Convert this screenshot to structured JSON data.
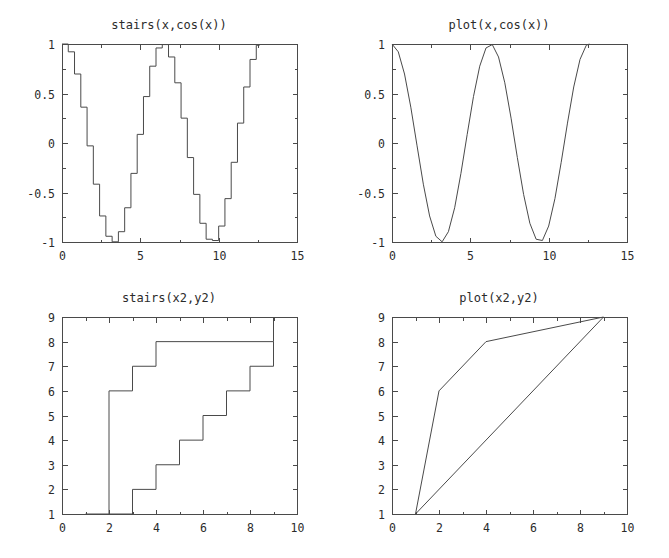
{
  "figure": {
    "width": 669,
    "height": 558,
    "background": "#ffffff",
    "line_color": "#4a4a4a",
    "text_color": "#2b2b2b",
    "layout": "2x2 subplot grid"
  },
  "chart_data": [
    {
      "id": "stairs-cos",
      "type": "line",
      "subtype": "stairs",
      "title": "stairs(x,cos(x))",
      "xlabel": "",
      "ylabel": "",
      "xlim": [
        0,
        15
      ],
      "ylim": [
        -1,
        1
      ],
      "xticks": [
        0,
        5,
        10,
        15
      ],
      "xticklabels": [
        "0",
        "5",
        "10",
        "15"
      ],
      "yticks": [
        -1,
        -0.5,
        0,
        0.5,
        1
      ],
      "yticklabels": [
        "-1",
        "-0.5",
        "0",
        "0.5",
        "1"
      ],
      "grid": false,
      "legend": null,
      "x": [
        0,
        0.4,
        0.8,
        1.2,
        1.6,
        2.0,
        2.4,
        2.8,
        3.2,
        3.6,
        4.0,
        4.4,
        4.8,
        5.2,
        5.6,
        6.0,
        6.4,
        6.8,
        7.2,
        7.6,
        8.0,
        8.4,
        8.8,
        9.2,
        9.6,
        10.0,
        10.4,
        10.8,
        11.2,
        11.6,
        12.0,
        12.4,
        12.6
      ],
      "y": [
        1.0,
        0.921,
        0.697,
        0.362,
        -0.029,
        -0.416,
        -0.737,
        -0.942,
        -0.998,
        -0.896,
        -0.654,
        -0.307,
        0.087,
        0.469,
        0.776,
        0.96,
        0.994,
        0.869,
        0.608,
        0.251,
        -0.147,
        -0.519,
        -0.811,
        -0.972,
        -0.985,
        -0.839,
        -0.562,
        -0.195,
        0.201,
        0.566,
        0.844,
        0.987,
        1.0
      ]
    },
    {
      "id": "plot-cos",
      "type": "line",
      "subtype": "continuous",
      "title": "plot(x,cos(x))",
      "xlabel": "",
      "ylabel": "",
      "xlim": [
        0,
        15
      ],
      "ylim": [
        -1,
        1
      ],
      "xticks": [
        0,
        5,
        10,
        15
      ],
      "xticklabels": [
        "0",
        "5",
        "10",
        "15"
      ],
      "yticks": [
        -1,
        -0.5,
        0,
        0.5,
        1
      ],
      "yticklabels": [
        "-1",
        "-0.5",
        "0",
        "0.5",
        "1"
      ],
      "grid": false,
      "legend": null,
      "x": [
        0,
        0.4,
        0.8,
        1.2,
        1.6,
        2.0,
        2.4,
        2.8,
        3.2,
        3.6,
        4.0,
        4.4,
        4.8,
        5.2,
        5.6,
        6.0,
        6.4,
        6.8,
        7.2,
        7.6,
        8.0,
        8.4,
        8.8,
        9.2,
        9.6,
        10.0,
        10.4,
        10.8,
        11.2,
        11.6,
        12.0,
        12.4,
        12.6
      ],
      "y": [
        1.0,
        0.921,
        0.697,
        0.362,
        -0.029,
        -0.416,
        -0.737,
        -0.942,
        -0.998,
        -0.896,
        -0.654,
        -0.307,
        0.087,
        0.469,
        0.776,
        0.96,
        0.994,
        0.869,
        0.608,
        0.251,
        -0.147,
        -0.519,
        -0.811,
        -0.972,
        -0.985,
        -0.839,
        -0.562,
        -0.195,
        0.201,
        0.566,
        0.844,
        0.987,
        1.0
      ]
    },
    {
      "id": "stairs-x2y2",
      "type": "line",
      "subtype": "stairs",
      "title": "stairs(x2,y2)",
      "xlabel": "",
      "ylabel": "",
      "xlim": [
        0,
        10
      ],
      "ylim": [
        1,
        9
      ],
      "xticks": [
        0,
        2,
        4,
        6,
        8,
        10
      ],
      "xticklabels": [
        "0",
        "2",
        "4",
        "6",
        "8",
        "10"
      ],
      "yticks": [
        1,
        2,
        3,
        4,
        5,
        6,
        7,
        8,
        9
      ],
      "yticklabels": [
        "1",
        "2",
        "3",
        "4",
        "5",
        "6",
        "7",
        "8",
        "9"
      ],
      "grid": false,
      "legend": null,
      "series": [
        {
          "name": "series-a",
          "x": [
            1,
            2,
            3,
            4,
            9
          ],
          "y": [
            1,
            6,
            7,
            8,
            9
          ]
        },
        {
          "name": "series-b",
          "x": [
            2,
            3,
            4,
            5,
            6,
            7,
            8,
            9
          ],
          "y": [
            1,
            2,
            3,
            4,
            5,
            6,
            7,
            8
          ]
        }
      ]
    },
    {
      "id": "plot-x2y2",
      "type": "line",
      "subtype": "continuous",
      "title": "plot(x2,y2)",
      "xlabel": "",
      "ylabel": "",
      "xlim": [
        0,
        10
      ],
      "ylim": [
        1,
        9
      ],
      "xticks": [
        0,
        2,
        4,
        6,
        8,
        10
      ],
      "xticklabels": [
        "0",
        "2",
        "4",
        "6",
        "8",
        "10"
      ],
      "yticks": [
        1,
        2,
        3,
        4,
        5,
        6,
        7,
        8,
        9
      ],
      "yticklabels": [
        "1",
        "2",
        "3",
        "4",
        "5",
        "6",
        "7",
        "8",
        "9"
      ],
      "grid": false,
      "legend": null,
      "series": [
        {
          "name": "series-a",
          "x": [
            1,
            2,
            4,
            9
          ],
          "y": [
            1,
            6,
            8,
            9
          ]
        },
        {
          "name": "series-b",
          "x": [
            1,
            9
          ],
          "y": [
            1,
            9
          ]
        }
      ]
    }
  ],
  "panels": {
    "top_left": {
      "title": "stairs(x,cos(x))",
      "chart_index": 0,
      "box": {
        "left": 8,
        "top": 18,
        "width": 322,
        "height": 262
      },
      "axes": {
        "x": 54,
        "y": 26,
        "w": 235,
        "h": 198
      }
    },
    "top_right": {
      "title": "plot(x,cos(x))",
      "chart_index": 1,
      "box": {
        "left": 338,
        "top": 18,
        "width": 322,
        "height": 262
      },
      "axes": {
        "x": 54,
        "y": 26,
        "w": 235,
        "h": 198
      }
    },
    "bottom_left": {
      "title": "stairs(x2,y2)",
      "chart_index": 2,
      "box": {
        "left": 8,
        "top": 291,
        "width": 322,
        "height": 262
      },
      "axes": {
        "x": 54,
        "y": 26,
        "w": 235,
        "h": 197
      }
    },
    "bottom_right": {
      "title": "plot(x2,y2)",
      "chart_index": 3,
      "box": {
        "left": 338,
        "top": 291,
        "width": 322,
        "height": 262
      },
      "axes": {
        "x": 54,
        "y": 26,
        "w": 235,
        "h": 197
      }
    }
  }
}
